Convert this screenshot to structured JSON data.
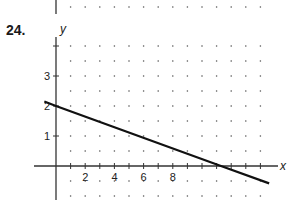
{
  "problem": {
    "number": "24."
  },
  "chart_data": {
    "type": "line",
    "title": "",
    "xlabel": "x",
    "ylabel": "y",
    "x_ticks": [
      2,
      4,
      6,
      8
    ],
    "x_tick_labels": [
      "2",
      "4",
      "6",
      "8"
    ],
    "y_ticks": [
      1,
      2,
      3
    ],
    "y_tick_labels": [
      "1",
      "2",
      "3"
    ],
    "xlim": [
      -0.8,
      15.5
    ],
    "ylim": [
      -1,
      4.3
    ],
    "grid": "dotted",
    "series": [
      {
        "name": "line",
        "x": [
          -0.8,
          0,
          11.3,
          14.6
        ],
        "y": [
          2.15,
          2.0,
          0.0,
          -0.58
        ]
      }
    ],
    "legend": "none"
  }
}
